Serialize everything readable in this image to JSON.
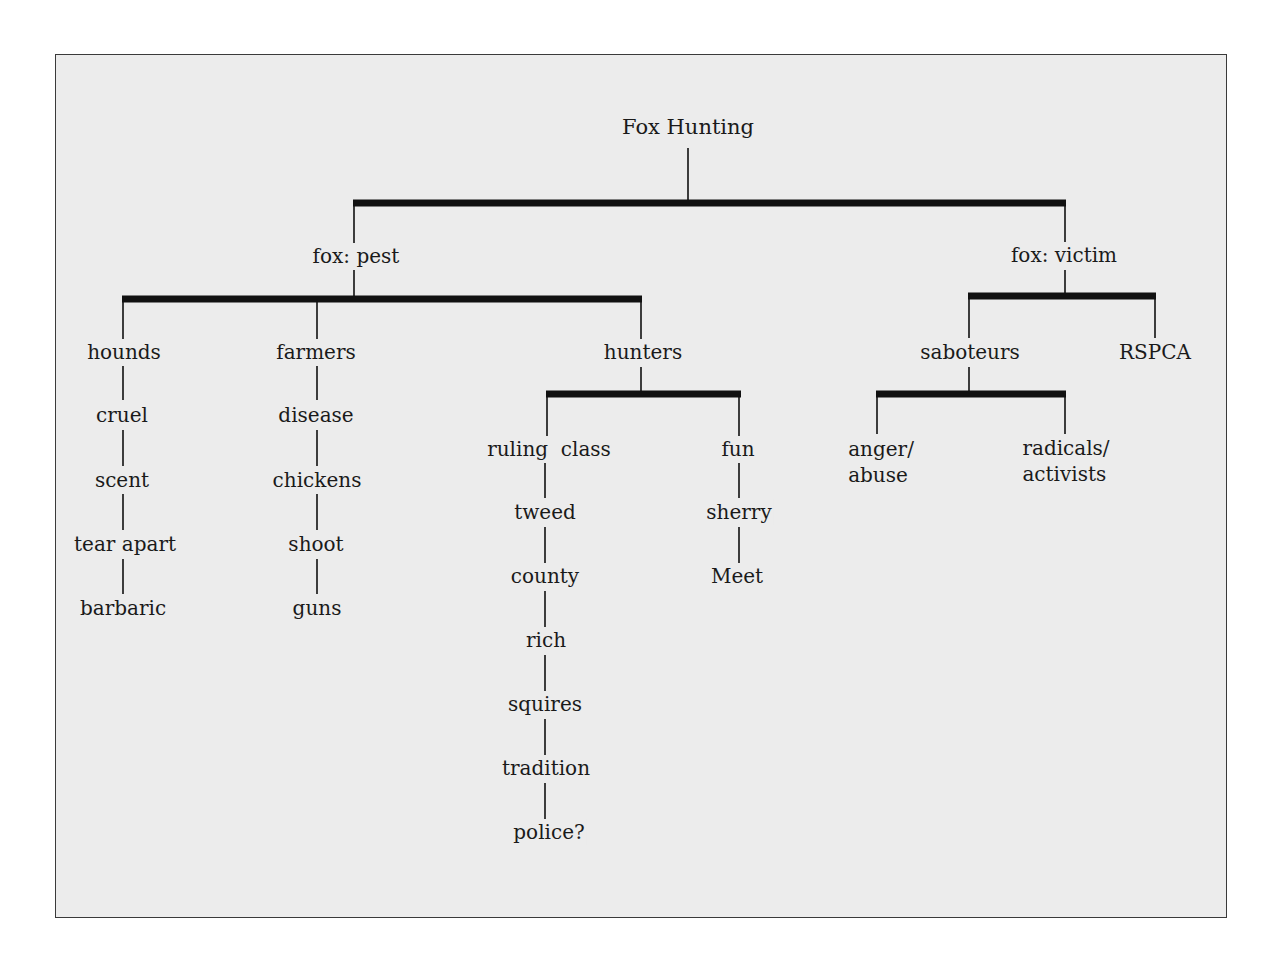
{
  "diagram": {
    "type": "tree",
    "root": "Fox Hunting",
    "branches": {
      "pest": {
        "label": "fox: pest",
        "hounds": {
          "label": "hounds",
          "chain": [
            "cruel",
            "scent",
            "tear apart",
            "barbaric"
          ]
        },
        "farmers": {
          "label": "farmers",
          "chain": [
            "disease",
            "chickens",
            "shoot",
            "guns"
          ]
        },
        "hunters": {
          "label": "hunters",
          "ruling_class": {
            "label": "ruling  class",
            "chain": [
              "tweed",
              "county",
              "rich",
              "squires",
              "tradition",
              "police?"
            ]
          },
          "fun": {
            "label": "fun",
            "chain": [
              "sherry",
              "Meet"
            ]
          }
        }
      },
      "victim": {
        "label": "fox: victim",
        "saboteurs": {
          "label": "saboteurs",
          "anger": {
            "line1": "anger/",
            "line2": "abuse"
          },
          "radicals": {
            "line1": "radicals/",
            "line2": "activists"
          }
        },
        "rspca": {
          "label": "RSPCA"
        }
      }
    },
    "colors": {
      "background": "#ececec",
      "line": "#111111",
      "text": "#1a1a1a"
    }
  }
}
